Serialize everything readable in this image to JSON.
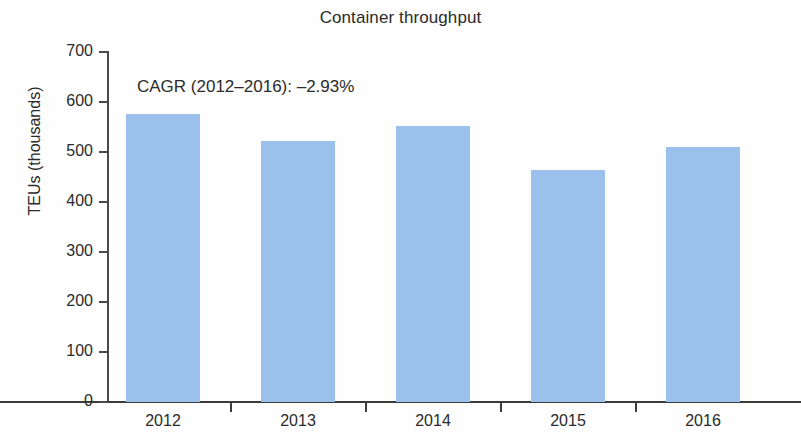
{
  "chart_data": {
    "type": "bar",
    "title": "Container throughput",
    "xlabel": "",
    "ylabel": "TEUs (thousands)",
    "categories": [
      "2012",
      "2013",
      "2014",
      "2015",
      "2016"
    ],
    "values": [
      576,
      522,
      552,
      464,
      510
    ],
    "series": [
      {
        "name": "Container throughput",
        "values": [
          576,
          522,
          552,
          464,
          510
        ],
        "color": "#9cc0ec"
      }
    ],
    "ylim": [
      0,
      700
    ],
    "ytick_labels": [
      "700",
      "600",
      "500",
      "400",
      "300",
      "200",
      "100",
      "0"
    ],
    "ytick_values": [
      700,
      600,
      500,
      400,
      300,
      200,
      100,
      0
    ],
    "grid": false,
    "legend": null,
    "legend_position": "none",
    "annotations": [
      {
        "name": "cagr-annotation",
        "text": "CAGR (2012–2016): –2.93%"
      }
    ]
  },
  "colors": {
    "bar": "#9cc0ec",
    "axis": "#3c3c3c",
    "text": "#2b2b2b",
    "background": "#fefefe"
  }
}
